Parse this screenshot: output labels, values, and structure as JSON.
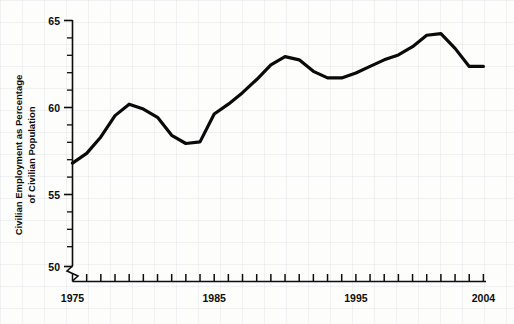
{
  "chart_data": {
    "type": "line",
    "title": "",
    "xlabel": "",
    "ylabel": "Civilian Employment as Percentage of Civilian Population",
    "ylabel_line1": "Civilian Employment as Percentage",
    "ylabel_line2": "of Civilian Population",
    "xlim": [
      1975,
      2004
    ],
    "ylim": [
      50,
      65
    ],
    "y_axis_break": true,
    "grid": false,
    "legend": null,
    "y_ticks_major": [
      50,
      55,
      60,
      65
    ],
    "y_tick_labels": [
      "50",
      "55",
      "60",
      "65"
    ],
    "y_tick_minor_step": 1,
    "x_ticks_major": [
      1975,
      1985,
      1995,
      2004
    ],
    "x_tick_labels": [
      "1975",
      "1985",
      "1995",
      "2004"
    ],
    "x_tick_minor_step": 1,
    "line_color": "#0a0a0a",
    "line_width": 3.2,
    "x": [
      1975,
      1976,
      1977,
      1978,
      1979,
      1980,
      1981,
      1982,
      1983,
      1984,
      1985,
      1986,
      1987,
      1988,
      1989,
      1990,
      1991,
      1992,
      1993,
      1994,
      1995,
      1996,
      1997,
      1998,
      1999,
      2000,
      2001,
      2002,
      2003,
      2004
    ],
    "values": [
      56.3,
      56.9,
      57.9,
      59.2,
      59.9,
      59.6,
      59.1,
      58.0,
      57.5,
      57.6,
      59.3,
      59.9,
      60.6,
      61.4,
      62.3,
      62.8,
      62.6,
      61.9,
      61.5,
      61.5,
      61.8,
      62.2,
      62.6,
      62.9,
      63.4,
      64.1,
      64.2,
      63.3,
      62.2,
      62.2
    ],
    "series_name": "Civilian employment-population ratio"
  },
  "figure": {
    "background_color": "#fdfdfc",
    "axis_color": "#0d0d0d"
  }
}
